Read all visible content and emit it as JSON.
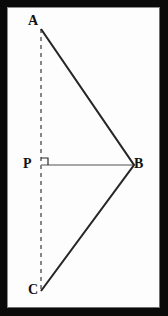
{
  "figure": {
    "border_color": "#0a0a0a",
    "background_color": "#fdfdfd",
    "solid_line_color": "#262626",
    "thin_line_color": "#8a8a8a",
    "dashed_line_color": "#555555",
    "label_color": "#111111",
    "labels": [
      {
        "id": "A",
        "text": "A",
        "x": 33,
        "y": 21
      },
      {
        "id": "P",
        "text": "P",
        "x": 28,
        "y": 164
      },
      {
        "id": "B",
        "text": "B",
        "x": 139,
        "y": 164
      },
      {
        "id": "C",
        "text": "C",
        "x": 33,
        "y": 290
      }
    ],
    "points": {
      "A": {
        "x": 33,
        "y": 21
      },
      "B": {
        "x": 126,
        "y": 157
      },
      "C": {
        "x": 33,
        "y": 283
      },
      "P": {
        "x": 33,
        "y": 157
      }
    },
    "segments": [
      {
        "name": "AB",
        "from": "A",
        "to": "B",
        "style": "solid",
        "width": 2
      },
      {
        "name": "BC",
        "from": "B",
        "to": "C",
        "style": "solid",
        "width": 2
      },
      {
        "name": "PB",
        "from": "P",
        "to": "B",
        "style": "thin",
        "width": 1
      },
      {
        "name": "AC",
        "from": "A",
        "to": "C",
        "style": "dashed",
        "width": 1
      }
    ],
    "right_angle_marker": {
      "at": "P",
      "size": 7,
      "description": "square marker indicating PB is perpendicular to AC"
    }
  }
}
